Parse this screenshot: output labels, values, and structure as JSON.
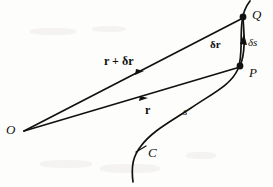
{
  "figure": {
    "kind": "vector-position-diagram",
    "background_color": "#fdfdfc",
    "ink_color": "#111111",
    "points": {
      "origin": {
        "label": "O",
        "x": 24,
        "y": 131,
        "label_x": 6,
        "label_y": 123
      },
      "p": {
        "label": "P",
        "x": 240,
        "y": 66,
        "label_x": 249,
        "label_y": 66
      },
      "q": {
        "label": "Q",
        "x": 243,
        "y": 17,
        "label_x": 252,
        "label_y": 8
      }
    },
    "labels": {
      "vector_r": "r",
      "vector_r_plus_dr": "r + δr",
      "delta_r": "δr",
      "delta_s": "δs",
      "arc_s": "s",
      "curve_c": "C"
    },
    "label_positions": {
      "vector_r": {
        "x": 145,
        "y": 104
      },
      "vector_r_plus_dr": {
        "x": 104,
        "y": 55
      },
      "delta_r": {
        "x": 210,
        "y": 39
      },
      "delta_s": {
        "x": 248,
        "y": 37
      },
      "arc_s": {
        "x": 183,
        "y": 106
      },
      "curve_c": {
        "x": 148,
        "y": 146
      }
    },
    "paths": {
      "curve_c": "M 133 182 C 131 166 133 156 141 146 C 152 131 170 122 191 108 C 213 93 231 85 238 69 C 243 57 240 36 242 22 C 243 12 246 6 250 1",
      "chord_op": "M 24 131 L 240 67",
      "chord_oq": "M 24 131 L 243 18",
      "chord_pq": "M 240 66 C 246 52 244 33 243 18"
    },
    "annotations": {
      "tick_on_curve": "short stroke crossing curve C near label",
      "arrowheads": [
        "mid-arrow on OP",
        "mid-arrow on OQ",
        "arrow on PQ chord pointing to Q"
      ]
    }
  }
}
